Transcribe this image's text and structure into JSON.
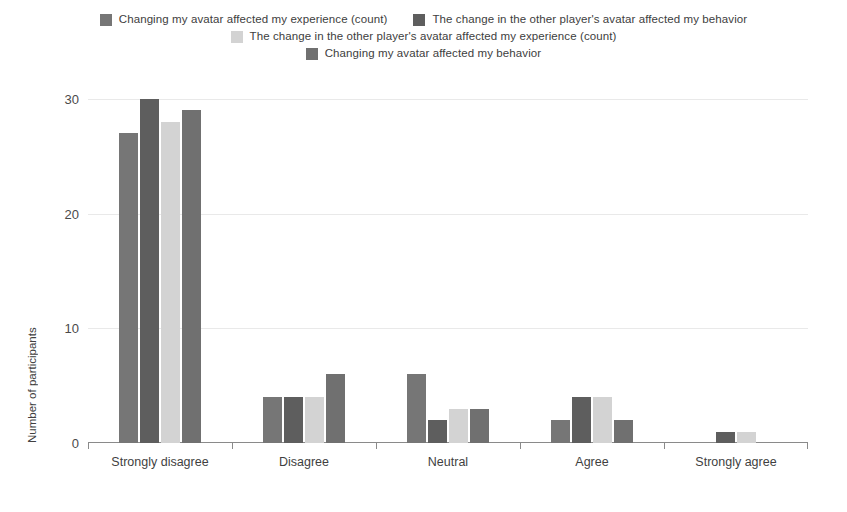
{
  "chart_data": {
    "type": "bar",
    "title": "",
    "subtitle": "",
    "xlabel": "",
    "ylabel": "Number of participants",
    "ylim": [
      0,
      30
    ],
    "yticks": [
      0,
      10,
      20,
      30
    ],
    "ytick_labels": [
      "0",
      "10",
      "20",
      "30"
    ],
    "grid": true,
    "grid_axis": "y",
    "legend_position": "top",
    "orientation": "vertical",
    "grouping": "grouped",
    "categories": [
      "Strongly disagree",
      "Disagree",
      "Neutral",
      "Agree",
      "Strongly agree"
    ],
    "series": [
      {
        "name": "Changing my avatar affected my experience (count)",
        "color": "#767676",
        "values": [
          27,
          4,
          6,
          2,
          0
        ]
      },
      {
        "name": "The change in the other player's avatar affected my behavior",
        "color": "#5e5e5e",
        "values": [
          30,
          4,
          2,
          4,
          1
        ]
      },
      {
        "name": "The change in the other player's avatar affected my experience (count)",
        "color": "#d3d3d3",
        "values": [
          28,
          4,
          3,
          4,
          1
        ]
      },
      {
        "name": "Changing my avatar affected my behavior",
        "color": "#707070",
        "values": [
          29,
          6,
          3,
          2,
          0
        ]
      }
    ]
  },
  "legend": {
    "rows": [
      [
        0,
        1
      ],
      [
        2
      ],
      [
        3
      ]
    ]
  },
  "colors": {
    "background": "#ffffff",
    "gridline": "#e9e9e9",
    "axis": "#8a8a8a",
    "text": "#3f3f3f",
    "series_1": "#767676",
    "series_2": "#5e5e5e",
    "series_3": "#d3d3d3",
    "series_4": "#707070"
  }
}
